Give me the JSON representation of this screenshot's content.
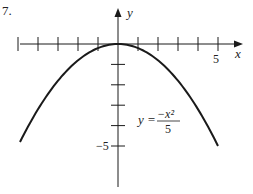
{
  "problem_number": "7.",
  "chart_data": {
    "type": "line",
    "title": "",
    "function": "y = -x^2/5",
    "equation_label": {
      "lhs": "y =",
      "numerator": "−x²",
      "denominator": "5"
    },
    "xlabel": "x",
    "ylabel": "y",
    "x_tick_labels": [
      {
        "value": 5,
        "label": "5"
      }
    ],
    "y_tick_labels": [
      {
        "value": -5,
        "label": "−5"
      }
    ],
    "x_ticks": [
      -5,
      -4,
      -3,
      -2,
      -1,
      1,
      2,
      3,
      4,
      5
    ],
    "y_ticks": [
      -1,
      -2,
      -3,
      -4,
      -5
    ],
    "xlim": [
      -5.8,
      6.2
    ],
    "ylim": [
      -7.2,
      2.2
    ],
    "grid": false,
    "legend": "none",
    "series": [
      {
        "name": "y = -x^2/5",
        "x": [
          -5,
          -4,
          -3,
          -2,
          -1,
          0,
          1,
          2,
          3,
          4,
          5
        ],
        "y": [
          -5,
          -3.2,
          -1.8,
          -0.8,
          -0.2,
          0,
          -0.2,
          -0.8,
          -1.8,
          -3.2,
          -5
        ]
      }
    ]
  },
  "colors": {
    "ink": "#1a1a1a",
    "background": "#ffffff"
  }
}
